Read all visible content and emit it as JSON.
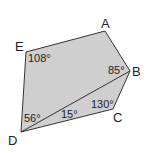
{
  "diagram": {
    "fill_color": "#cfcfcf",
    "stroke_color": "#333333",
    "vertices": [
      {
        "name": "A",
        "x": 105,
        "y": 31,
        "label_x": 101,
        "label_y": 28
      },
      {
        "name": "B",
        "x": 130,
        "y": 71,
        "label_x": 132,
        "label_y": 76
      },
      {
        "name": "C",
        "x": 113,
        "y": 109,
        "label_x": 113,
        "label_y": 122
      },
      {
        "name": "D",
        "x": 21,
        "y": 132,
        "label_x": 8,
        "label_y": 145
      },
      {
        "name": "E",
        "x": 26,
        "y": 52,
        "label_x": 15,
        "label_y": 51
      }
    ],
    "diagonal": {
      "from": "D",
      "to": "B"
    },
    "angles": [
      {
        "label": "108°",
        "at": "E",
        "x": 28,
        "y": 62
      },
      {
        "label": "85°",
        "at": "B",
        "x": 108,
        "y": 74
      },
      {
        "label": "130°",
        "at": "C",
        "x": 91,
        "y": 108
      },
      {
        "label": "56°",
        "at": "D",
        "x": 24,
        "y": 122
      },
      {
        "label": "15°",
        "at": "D",
        "x": 61,
        "y": 118
      }
    ]
  }
}
